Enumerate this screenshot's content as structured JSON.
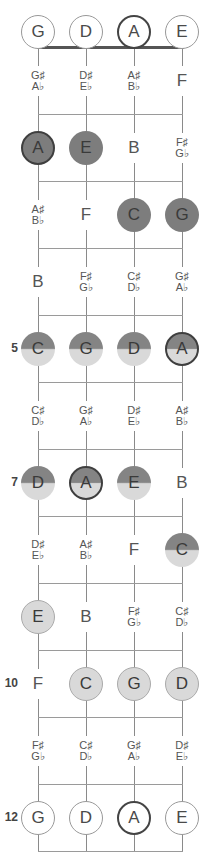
{
  "strings": [
    {
      "name": "G",
      "x": 38
    },
    {
      "name": "D",
      "x": 86
    },
    {
      "name": "A",
      "x": 134
    },
    {
      "name": "E",
      "x": 182
    }
  ],
  "open_notes": [
    {
      "label": "G",
      "style": "open"
    },
    {
      "label": "D",
      "style": "open"
    },
    {
      "label": "A",
      "style": "open root"
    },
    {
      "label": "E",
      "style": "open"
    }
  ],
  "fret_markers": [
    {
      "fret": 5,
      "label": "5"
    },
    {
      "fret": 7,
      "label": "7"
    },
    {
      "fret": 10,
      "label": "10"
    },
    {
      "fret": 12,
      "label": "12"
    }
  ],
  "frets": [
    {
      "fret": 1,
      "notes": [
        {
          "sharp": "G♯",
          "flat": "A♭",
          "style": "plain"
        },
        {
          "sharp": "D♯",
          "flat": "E♭",
          "style": "plain"
        },
        {
          "sharp": "A♯",
          "flat": "B♭",
          "style": "plain"
        },
        {
          "label": "F",
          "style": "plain"
        }
      ]
    },
    {
      "fret": 2,
      "notes": [
        {
          "label": "A",
          "style": "dark root"
        },
        {
          "label": "E",
          "style": "dark"
        },
        {
          "label": "B",
          "style": "plain"
        },
        {
          "sharp": "F♯",
          "flat": "G♭",
          "style": "plain"
        }
      ]
    },
    {
      "fret": 3,
      "notes": [
        {
          "sharp": "A♯",
          "flat": "B♭",
          "style": "plain"
        },
        {
          "label": "F",
          "style": "plain"
        },
        {
          "label": "C",
          "style": "dark"
        },
        {
          "label": "G",
          "style": "dark"
        }
      ]
    },
    {
      "fret": 4,
      "notes": [
        {
          "label": "B",
          "style": "plain"
        },
        {
          "sharp": "F♯",
          "flat": "G♭",
          "style": "plain"
        },
        {
          "sharp": "C♯",
          "flat": "D♭",
          "style": "plain"
        },
        {
          "sharp": "G♯",
          "flat": "A♭",
          "style": "plain"
        }
      ]
    },
    {
      "fret": 5,
      "notes": [
        {
          "label": "C",
          "style": "half"
        },
        {
          "label": "G",
          "style": "half"
        },
        {
          "label": "D",
          "style": "half"
        },
        {
          "label": "A",
          "style": "half root"
        }
      ]
    },
    {
      "fret": 6,
      "notes": [
        {
          "sharp": "C♯",
          "flat": "D♭",
          "style": "plain"
        },
        {
          "sharp": "G♯",
          "flat": "A♭",
          "style": "plain"
        },
        {
          "sharp": "D♯",
          "flat": "E♭",
          "style": "plain"
        },
        {
          "sharp": "A♯",
          "flat": "B♭",
          "style": "plain"
        }
      ]
    },
    {
      "fret": 7,
      "notes": [
        {
          "label": "D",
          "style": "half"
        },
        {
          "label": "A",
          "style": "half root"
        },
        {
          "label": "E",
          "style": "half"
        },
        {
          "label": "B",
          "style": "plain"
        }
      ]
    },
    {
      "fret": 8,
      "notes": [
        {
          "sharp": "D♯",
          "flat": "E♭",
          "style": "plain"
        },
        {
          "sharp": "A♯",
          "flat": "B♭",
          "style": "plain"
        },
        {
          "label": "F",
          "style": "plain"
        },
        {
          "label": "C",
          "style": "half"
        }
      ]
    },
    {
      "fret": 9,
      "notes": [
        {
          "label": "E",
          "style": "light"
        },
        {
          "label": "B",
          "style": "plain"
        },
        {
          "sharp": "F♯",
          "flat": "G♭",
          "style": "plain"
        },
        {
          "sharp": "C♯",
          "flat": "D♭",
          "style": "plain"
        }
      ]
    },
    {
      "fret": 10,
      "notes": [
        {
          "label": "F",
          "style": "plain"
        },
        {
          "label": "C",
          "style": "light"
        },
        {
          "label": "G",
          "style": "light"
        },
        {
          "label": "D",
          "style": "light"
        }
      ]
    },
    {
      "fret": 11,
      "notes": [
        {
          "sharp": "F♯",
          "flat": "G♭",
          "style": "plain"
        },
        {
          "sharp": "C♯",
          "flat": "D♭",
          "style": "plain"
        },
        {
          "sharp": "G♯",
          "flat": "A♭",
          "style": "plain"
        },
        {
          "sharp": "D♯",
          "flat": "E♭",
          "style": "plain"
        }
      ]
    },
    {
      "fret": 12,
      "notes": [
        {
          "label": "G",
          "style": "open"
        },
        {
          "label": "D",
          "style": "open"
        },
        {
          "label": "A",
          "style": "open root"
        },
        {
          "label": "E",
          "style": "open"
        }
      ]
    }
  ],
  "colors": {
    "dark_fill": "#7d7d7d",
    "light_fill": "#d9d9d9",
    "root_border": "#3f3f3f",
    "line": "#8a8a8a"
  }
}
